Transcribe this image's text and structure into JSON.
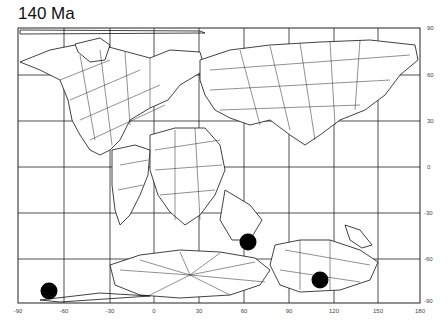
{
  "title": "140 Ma",
  "map": {
    "projection": "equirectangular",
    "x_ticks": [
      "-90",
      "-60",
      "-30",
      "0",
      "30",
      "60",
      "90",
      "120",
      "150",
      "180"
    ],
    "y_ticks": [
      "90",
      "60",
      "30",
      "0",
      "-30",
      "-60",
      "-90"
    ],
    "grid_color": "#222222",
    "coast_color": "#111111",
    "markers": [
      {
        "name": "site-1",
        "lon": -72,
        "lat": -85
      },
      {
        "name": "site-2",
        "lon": 62,
        "lat": -49
      },
      {
        "name": "site-3",
        "lon": 110,
        "lat": -74
      }
    ]
  }
}
